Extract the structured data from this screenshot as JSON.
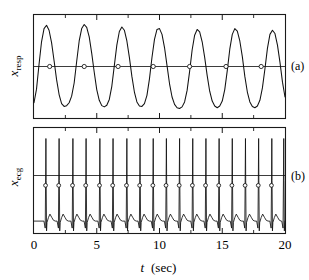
{
  "figure": {
    "panel_a_label": "(a)",
    "panel_b_label": "(b)",
    "x_axis_label_symbol": "t",
    "x_axis_label_unit": "(sec)",
    "y_label_a_base": "x",
    "y_label_a_sub": "resp",
    "y_label_b_base": "x",
    "y_label_b_sub": "ecg",
    "tick_labels": [
      "0",
      "5",
      "10",
      "15",
      "20"
    ],
    "colors": {
      "signal": "#111111",
      "frame": "#1a1a1a",
      "reference_line": "#3d3d3d",
      "marker_fill": "#ffffff",
      "background": "#ffffff"
    }
  },
  "chart_data": [
    {
      "type": "line",
      "id": "panel-a-respiration",
      "title": "",
      "xlabel": "t  (sec)",
      "ylabel": "x_resp",
      "panel": "(a)",
      "xlim": [
        0,
        20
      ],
      "ylim": [
        -1.25,
        1.25
      ],
      "xticks": [
        0,
        5,
        10,
        15,
        20
      ],
      "xticks_minor": [
        2.5,
        7.5,
        12.5,
        17.5
      ],
      "yticks": [],
      "grid": false,
      "legend": "none",
      "reference_line_y": 0,
      "description": "Quasi-sinusoidal respiration signal, approximately 7 breathing cycles over 20 seconds, with open-circle markers at upward zero crossings of the reference line.",
      "series": [
        {
          "name": "x_resp",
          "cycle_count": 7,
          "mean_period_sec": 2.72,
          "x": [
            0.0,
            0.2,
            0.4,
            0.6,
            0.8,
            1.0,
            1.2,
            1.4,
            1.6,
            1.8,
            2.0,
            2.2,
            2.4,
            2.6,
            2.8,
            3.0,
            3.2,
            3.4,
            3.6,
            3.8,
            4.0,
            4.2,
            4.4,
            4.6,
            4.8,
            5.0,
            5.2,
            5.4,
            5.6,
            5.8,
            6.0,
            6.2,
            6.4,
            6.6,
            6.8,
            7.0,
            7.2,
            7.4,
            7.6,
            7.8,
            8.0,
            8.2,
            8.4,
            8.6,
            8.8,
            9.0,
            9.2,
            9.4,
            9.6,
            9.8,
            10.0,
            10.2,
            10.4,
            10.6,
            10.8,
            11.0,
            11.2,
            11.4,
            11.6,
            11.8,
            12.0,
            12.2,
            12.4,
            12.6,
            12.8,
            13.0,
            13.2,
            13.4,
            13.6,
            13.8,
            14.0,
            14.2,
            14.4,
            14.6,
            14.8,
            15.0,
            15.2,
            15.4,
            15.6,
            15.8,
            16.0,
            16.2,
            16.4,
            16.6,
            16.8,
            17.0,
            17.2,
            17.4,
            17.6,
            17.8,
            18.0,
            18.2,
            18.4,
            18.6,
            18.8,
            19.0,
            19.2,
            19.4,
            19.6,
            19.8,
            20.0
          ],
          "y": [
            -0.88,
            -0.55,
            0.05,
            0.6,
            0.92,
            1.0,
            0.88,
            0.58,
            0.14,
            -0.32,
            -0.68,
            -0.9,
            -0.97,
            -0.95,
            -0.88,
            -0.72,
            -0.4,
            0.12,
            0.62,
            0.92,
            1.02,
            0.95,
            0.72,
            0.32,
            -0.14,
            -0.56,
            -0.82,
            -0.95,
            -0.98,
            -0.94,
            -0.8,
            -0.48,
            0.02,
            0.52,
            0.85,
            0.96,
            0.88,
            0.62,
            0.22,
            -0.24,
            -0.62,
            -0.86,
            -0.96,
            -0.97,
            -0.9,
            -0.7,
            -0.3,
            0.22,
            0.66,
            0.9,
            0.92,
            0.78,
            0.46,
            0.02,
            -0.42,
            -0.74,
            -0.92,
            -1.0,
            -1.02,
            -0.98,
            -0.86,
            -0.58,
            -0.12,
            0.4,
            0.76,
            0.9,
            0.84,
            0.6,
            0.22,
            -0.22,
            -0.6,
            -0.84,
            -0.96,
            -1.0,
            -0.96,
            -0.84,
            -0.56,
            -0.1,
            0.42,
            0.78,
            0.92,
            0.86,
            0.62,
            0.24,
            -0.24,
            -0.62,
            -0.86,
            -0.97,
            -1.0,
            -0.96,
            -0.82,
            -0.52,
            -0.06,
            0.44,
            0.78,
            0.88,
            0.8,
            0.52,
            0.1,
            -0.38,
            -0.74
          ]
        }
      ],
      "markers": {
        "name": "zero-crossing markers",
        "style": "open circle",
        "y": 0,
        "x": [
          1.25,
          4.0,
          6.7,
          9.5,
          12.4,
          15.3,
          18.1
        ]
      }
    },
    {
      "type": "line",
      "id": "panel-b-ecg",
      "title": "",
      "xlabel": "t  (sec)",
      "ylabel": "x_ecg",
      "panel": "(b)",
      "xlim": [
        0,
        20
      ],
      "ylim": [
        -0.35,
        1.15
      ],
      "xticks": [
        0,
        5,
        10,
        15,
        20
      ],
      "xticks_minor": [
        2.5,
        7.5,
        12.5,
        17.5
      ],
      "yticks": [],
      "grid": false,
      "legend": "none",
      "reference_line_y": 0.33,
      "description": "ECG signal with sharp R-peak spikes, roughly 19 heartbeats over 20 seconds, baseline with small T-wave bumps; open-circle markers placed on each R-peak upstroke at the reference level.",
      "series": [
        {
          "name": "x_ecg",
          "beat_count": 19,
          "mean_rr_interval_sec": 1.06,
          "mean_heart_rate_bpm": 57,
          "r_peak_times": [
            0.95,
            2.0,
            3.1,
            4.15,
            5.25,
            6.3,
            7.4,
            8.45,
            9.5,
            10.55,
            11.6,
            12.65,
            13.7,
            14.75,
            15.8,
            16.85,
            17.9,
            18.95,
            19.9
          ],
          "r_peak_amplitude": 1.0,
          "baseline_amplitude": -0.18,
          "t_wave_amplitude": -0.05
        }
      ],
      "markers": {
        "name": "R-peak upstroke markers",
        "style": "open circle",
        "y": 0.33,
        "x": [
          0.92,
          1.97,
          3.07,
          4.12,
          5.22,
          6.27,
          7.37,
          8.42,
          9.47,
          10.52,
          11.57,
          12.62,
          13.67,
          14.72,
          15.77,
          16.82,
          17.87,
          18.92
        ]
      }
    }
  ]
}
